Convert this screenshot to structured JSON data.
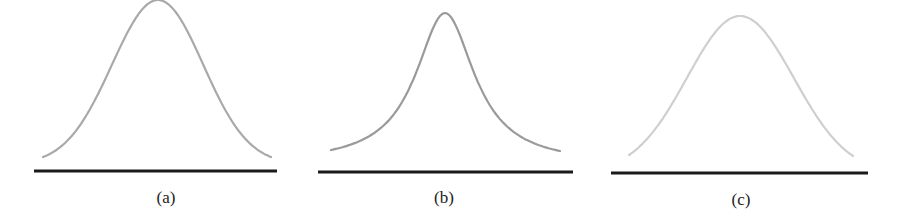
{
  "figure": {
    "panels": [
      {
        "label": "(a)",
        "curve": {
          "shape": "normal-bell",
          "description": "tall, moderately wide bell curve",
          "color": "#a9a9a9",
          "peak": [
            158,
            0
          ],
          "left_tail": [
            43,
            157
          ],
          "right_tail": [
            271,
            157
          ]
        },
        "baseline": {
          "x1": 34,
          "x2": 277,
          "y": 171,
          "color": "#1a1a1a"
        },
        "label_pos": [
          166,
          188
        ]
      },
      {
        "label": "(b)",
        "curve": {
          "shape": "peaked-bell",
          "description": "sharper peak with heavier tails",
          "color": "#9a9a9a",
          "peak": [
            445,
            13
          ],
          "left_tail": [
            331,
            150
          ],
          "right_tail": [
            560,
            151
          ]
        },
        "baseline": {
          "x1": 318,
          "x2": 573,
          "y": 172,
          "color": "#1a1a1a"
        },
        "label_pos": [
          444,
          188
        ]
      },
      {
        "label": "(c)",
        "curve": {
          "shape": "flat-bell",
          "description": "flatter, broader rounded peak",
          "color": "#cfcfcf",
          "peak": [
            740,
            16
          ],
          "left_tail": [
            629,
            155
          ],
          "right_tail": [
            853,
            156
          ]
        },
        "baseline": {
          "x1": 611,
          "x2": 868,
          "y": 173,
          "color": "#1a1a1a"
        },
        "label_pos": [
          741,
          190
        ]
      }
    ]
  }
}
